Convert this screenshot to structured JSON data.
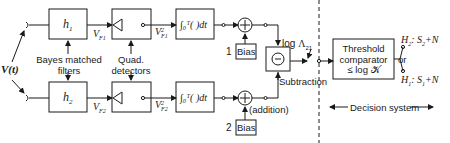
{
  "diagram": {
    "input": {
      "label": "V(t)"
    },
    "filters": {
      "top": {
        "label": "h",
        "sub": "1"
      },
      "bottom": {
        "label": "h",
        "sub": "2"
      },
      "caption_line1": "Bayes matched",
      "caption_line2": "filters"
    },
    "filter_outputs": {
      "top": {
        "label": "V",
        "sub": "F1"
      },
      "bottom": {
        "label": "V",
        "sub": "F2"
      }
    },
    "detectors": {
      "caption_line1": "Quad.",
      "caption_line2": "detectors"
    },
    "detector_outputs": {
      "top": {
        "label": "V",
        "sup": "2",
        "sub": "F1"
      },
      "bottom": {
        "label": "V",
        "sup": "2",
        "sub": "F2"
      }
    },
    "integrators": {
      "top": {
        "label": "∫₀ᵀ( )dt"
      },
      "bottom": {
        "label": "∫₀ᵀ( )dt"
      }
    },
    "adders": {
      "symbol": "+",
      "caption": "(addition)"
    },
    "biases": {
      "top": {
        "index": "1",
        "label": "Bias"
      },
      "bottom": {
        "index": "2",
        "label": "Bias"
      }
    },
    "subtractor": {
      "symbol": "−",
      "caption": "Subtraction"
    },
    "log_ratio": {
      "prefix": "log",
      "symbol": "Λ",
      "sub": "21"
    },
    "comparator": {
      "line1": "Threshold",
      "line2": "comparator",
      "line3": "≤ log 𝒦"
    },
    "outputs": {
      "h2": {
        "label": "H",
        "sub": "2",
        "rest": ": S",
        "rest_sub": "2",
        "tail": "+N"
      },
      "or": "or",
      "h1": {
        "label": "H",
        "sub": "1",
        "rest": ": S",
        "rest_sub": "1",
        "tail": "+N"
      }
    },
    "decision_system": {
      "label": "Decision system"
    }
  }
}
